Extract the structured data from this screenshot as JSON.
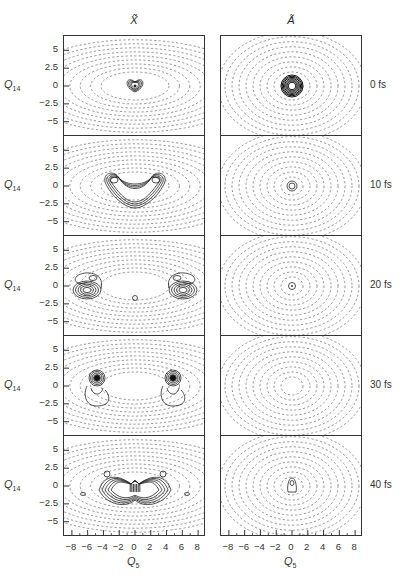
{
  "figure": {
    "columns": [
      {
        "title": "X̃",
        "state": "X"
      },
      {
        "title": "Ã",
        "state": "A"
      }
    ],
    "rows": [
      {
        "time_label": "0 fs"
      },
      {
        "time_label": "10 fs"
      },
      {
        "time_label": "20 fs"
      },
      {
        "time_label": "30 fs"
      },
      {
        "time_label": "40 fs"
      }
    ],
    "y_axis": {
      "name": "Q",
      "subscript": "14",
      "ticks": [
        "5",
        "2.5",
        "0",
        "−2.5",
        "−5"
      ]
    },
    "x_axis": {
      "name": "Q",
      "subscript": "5",
      "ticks": [
        "−8",
        "−6",
        "−4",
        "−2",
        "0",
        "2",
        "4",
        "6",
        "8"
      ]
    },
    "colors": {
      "ink": "#2a2a2a",
      "dashed": "#555555",
      "background": "#ffffff"
    }
  },
  "chart_data": {
    "type": "contour",
    "xlabel": "Q5",
    "ylabel": "Q14",
    "xlim": [
      -9,
      9
    ],
    "ylim": [
      -7,
      7
    ],
    "x_ticks": [
      -8,
      -6,
      -4,
      -2,
      0,
      2,
      4,
      6,
      8
    ],
    "y_ticks": [
      5,
      2.5,
      0,
      -2.5,
      -5
    ],
    "grid": false,
    "panels": [
      {
        "state": "X̃",
        "time_fs": 0,
        "description": "small compact wavepacket at origin (Q5≈0, Q14≈0), solid contours over dashed elliptical potential contours"
      },
      {
        "state": "X̃",
        "time_fs": 10,
        "description": "wavepacket spreads into a U/horseshoe shape with lobes near Q5≈±3, Q14≈+1 and base at Q14≈−2"
      },
      {
        "state": "X̃",
        "time_fs": 20,
        "description": "two separated lobes near Q5≈±6, Q14≈0, plus small contour at origin Q14≈−1"
      },
      {
        "state": "X̃",
        "time_fs": 30,
        "description": "two dense lobes near Q5≈±5, Q14≈+1 with tails down to Q14≈−2.5"
      },
      {
        "state": "X̃",
        "time_fs": 40,
        "description": "complex interference pattern concentrated around Q5∈[−4,4], Q14∈[−2.5,2]"
      },
      {
        "state": "Ã",
        "time_fs": 0,
        "description": "dense concentric solid contours at origin"
      },
      {
        "state": "Ã",
        "time_fs": 10,
        "description": "two small concentric circles at origin"
      },
      {
        "state": "Ã",
        "time_fs": 20,
        "description": "single small circle with dot at origin"
      },
      {
        "state": "Ã",
        "time_fs": 30,
        "description": "no solid contours; only dashed potential ellipses"
      },
      {
        "state": "Ã",
        "time_fs": 40,
        "description": "small elongated contour at origin (Q14 ≈ −1 to 0)"
      }
    ]
  }
}
